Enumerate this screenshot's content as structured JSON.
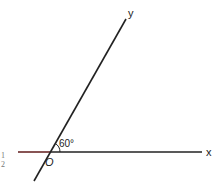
{
  "diagram": {
    "labels": {
      "x_axis": "x",
      "y_axis": "y",
      "origin": "O",
      "angle": "60°"
    },
    "side_marks": [
      "1",
      "2"
    ],
    "colors": {
      "line": "#222222",
      "left_segment": "#6b2a2a"
    }
  }
}
